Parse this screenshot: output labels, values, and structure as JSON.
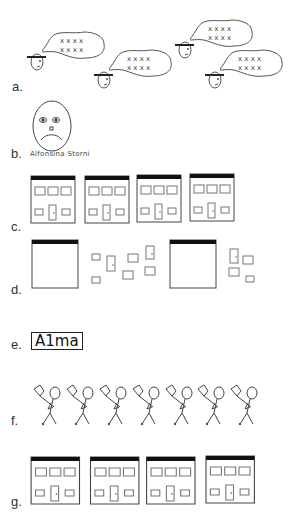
{
  "figure": {
    "panels": [
      {
        "id": "a",
        "label": "a.",
        "description": "four cartoon heads with hats and thought bubbles containing x marks",
        "thought_bubble_marks": [
          "x x x x",
          "x x x x"
        ]
      },
      {
        "id": "b",
        "label": "b.",
        "description": "sad face portrait",
        "caption": "Alfonsina Storni"
      },
      {
        "id": "c",
        "label": "c.",
        "description": "four building facades"
      },
      {
        "id": "d",
        "label": "d.",
        "description": "empty building frames with scattered windows and doors"
      },
      {
        "id": "e",
        "label": "e.",
        "description": "boxed word",
        "text": "A1ma"
      },
      {
        "id": "f",
        "label": "f.",
        "description": "seven stick figures carrying nets",
        "count": 7
      },
      {
        "id": "g",
        "label": "g.",
        "description": "four building facades"
      }
    ]
  },
  "colors": {
    "stroke": "#555555",
    "roof": "#111111",
    "background": "#ffffff"
  }
}
